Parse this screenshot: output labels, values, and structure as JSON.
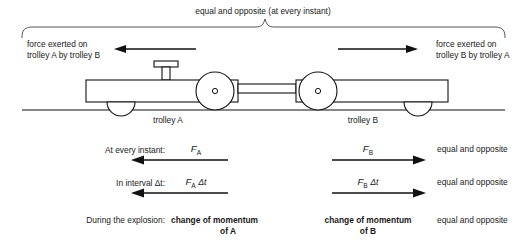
{
  "figure": {
    "top_caption": "equal and opposite (at every instant)",
    "force_label_left_line1": "force exerted on",
    "force_label_left_line2": "trolley A by trolley B",
    "force_label_right_line1": "force exerted on",
    "force_label_right_line2": "trolley B by trolley A",
    "trolley_a_label": "trolley A",
    "trolley_b_label": "trolley B",
    "ink_color": "#111111",
    "background_color": "#ffffff"
  },
  "rows": [
    {
      "label": "At every instant:",
      "left_symbol": "F",
      "left_subscript": "A",
      "left_suffix": "",
      "right_symbol": "F",
      "right_subscript": "B",
      "right_suffix": "",
      "note": "equal and opposite",
      "bold": false
    },
    {
      "label": "In interval Δt:",
      "left_symbol": "F",
      "left_subscript": "A",
      "left_suffix": "Δt",
      "right_symbol": "F",
      "right_subscript": "B",
      "right_suffix": "Δt",
      "note": "equal and opposite",
      "bold": false
    },
    {
      "label": "During the explosion:",
      "left_text_line1": "change of momentum",
      "left_text_line2": "of A",
      "right_text_line1": "change of momentum",
      "right_text_line2": "of B",
      "note": "equal and opposite",
      "bold": true
    }
  ],
  "icons": {
    "brace": "curly-brace-icon",
    "arrow_left": "arrow-left-icon",
    "arrow_right": "arrow-right-icon",
    "trolley": "trolley-icon",
    "wheel": "wheel-icon",
    "plunger": "plunger-icon",
    "ground": "ground-line-icon"
  }
}
